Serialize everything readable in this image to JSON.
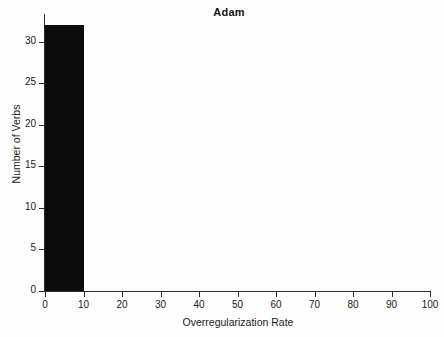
{
  "chart_data": {
    "type": "bar",
    "title": "Adam",
    "xlabel": "Overregularization Rate",
    "ylabel": "Number of Verbs",
    "categories": [
      "0-10",
      "10-20",
      "20-30",
      "30-40",
      "40-50",
      "50-60",
      "60-70",
      "70-80",
      "80-90",
      "90-100"
    ],
    "bin_starts": [
      0,
      10,
      20,
      30,
      40,
      50,
      60,
      70,
      80,
      90
    ],
    "bin_width": 10,
    "values": [
      32,
      0,
      0,
      0,
      0,
      0,
      0,
      0,
      0,
      0
    ],
    "xlim": [
      0,
      100
    ],
    "ylim": [
      0,
      32.5
    ],
    "xticks": [
      0,
      10,
      20,
      30,
      40,
      50,
      60,
      70,
      80,
      90,
      100
    ],
    "yticks": [
      0,
      5,
      10,
      15,
      20,
      25,
      30
    ],
    "xtick_labels": [
      "0",
      "10",
      "20",
      "30",
      "40",
      "50",
      "60",
      "70",
      "80",
      "90",
      "100"
    ],
    "ytick_labels": [
      "0",
      "5",
      "10",
      "15",
      "20",
      "25",
      "30"
    ],
    "grid": false,
    "legend": null,
    "bar_color": "#0b0b0b",
    "axis_color": "#2b2b2b",
    "background_color": "#ffffff"
  }
}
